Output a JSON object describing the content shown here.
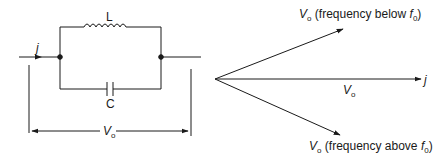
{
  "circuit": {
    "inductor_label": "L",
    "capacitor_label": "C",
    "current_label": "j",
    "voltage_label": "V",
    "voltage_subscript": "o"
  },
  "phasor": {
    "reference_label": "j",
    "horizontal_label": "V",
    "horizontal_subscript": "o",
    "upper": {
      "symbol": "V",
      "subscript": "o",
      "text_prefix": " (frequency below ",
      "freq_symbol": "f",
      "freq_subscript": "0",
      "text_suffix": ")"
    },
    "lower": {
      "symbol": "V",
      "subscript": "o",
      "text_prefix": " (frequency above ",
      "freq_symbol": "f",
      "freq_subscript": "0",
      "text_suffix": ")"
    }
  },
  "colors": {
    "line": "#1a1a1a",
    "background": "#ffffff"
  }
}
